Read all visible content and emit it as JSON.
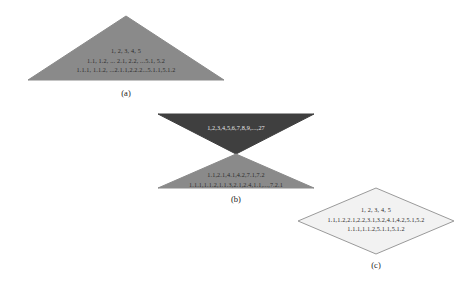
{
  "figure": {
    "background_color": "#ffffff",
    "shapes": [
      {
        "id": "a",
        "name": "upright-triangle",
        "label": "(a)",
        "fill_color": "#8a8a8a",
        "stroke_color": "#8a8a8a",
        "text_color": "#2a2a2a",
        "levels": [
          "1, 2, 3, 4, 5",
          "1.1, 1.2, ... 2.1, 2.2, ...5.1, 5.2",
          "1.1.1, 1.1.2, ...2.1.1,2.2.2...5.1.1,5.1.2"
        ]
      },
      {
        "id": "b",
        "name": "hourglass",
        "label": "(b)",
        "top_fill_color": "#3f3f3f",
        "bottom_fill_color": "#8a8a8a",
        "top_text_color": "#e8e8e8",
        "bottom_text_color": "#2a2a2a",
        "top_levels": [
          "1,2,3,4,5,6,7,8,9,...,27"
        ],
        "bottom_levels": [
          "1.1,2.1,4.1,4.2,7.1,7.2",
          "1.1.1,1.1.2,1.1.3,2.1,2.4,1.1,...,7.2.1"
        ]
      },
      {
        "id": "c",
        "name": "diamond",
        "label": "(c)",
        "fill_color": "#f2f2f2",
        "stroke_color": "#9a9a9a",
        "text_color": "#2a2a2a",
        "levels": [
          "1, 2, 3, 4, 5",
          "1.1,1.2,2.1,2.2,3.1,3.2,4.1,4.2,5.1,5.2",
          "1.1.1,1.1.2,5.1.1,5.1.2"
        ]
      }
    ]
  }
}
